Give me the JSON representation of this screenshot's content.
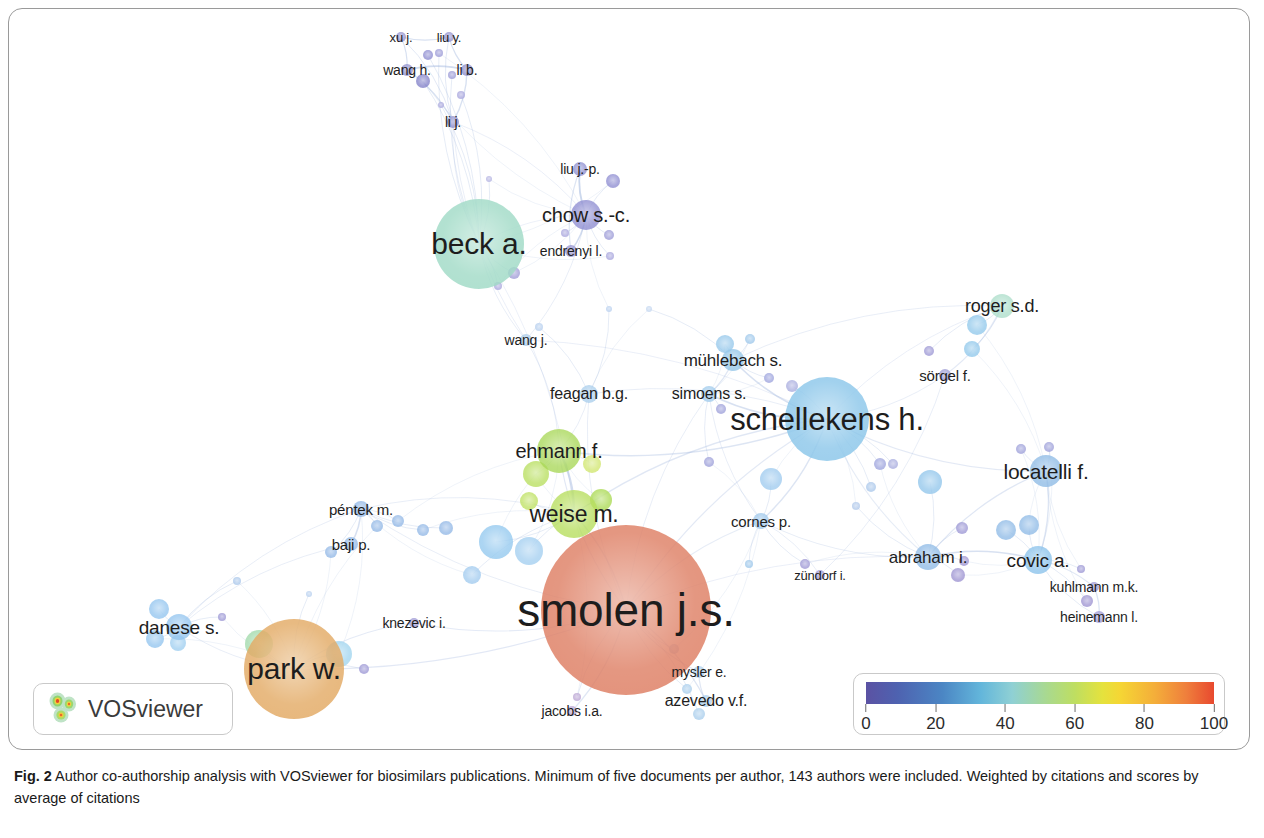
{
  "figure": {
    "label": "Fig. 2",
    "caption": "Author co-authorship analysis with VOSviewer for biosimilars publications. Minimum of five documents per author, 143 authors were included. Weighted by citations and scores by average of citations"
  },
  "branding": {
    "name": "VOSviewer",
    "logo_icon": "vosviewer-heatmap-logo-icon"
  },
  "legend": {
    "title": "",
    "ticks": [
      "0",
      "20",
      "40",
      "60",
      "80",
      "100"
    ],
    "min": 0,
    "max": 100,
    "gradient_stops": [
      "#5b52a3",
      "#4b86c4",
      "#63b6db",
      "#a9d98f",
      "#e5e23d",
      "#f4ae3a",
      "#e8492f"
    ]
  },
  "chart_data": {
    "type": "scatter",
    "title": "Author co-authorship analysis with VOSviewer for biosimilars publications",
    "xlabel": "",
    "ylabel": "",
    "color_scale": {
      "label": "average citations",
      "min": 0,
      "max": 100,
      "ticks": [
        0,
        20,
        40,
        60,
        80,
        100
      ]
    },
    "nodes": [
      {
        "label": "xu j.",
        "x": 392,
        "y": 28,
        "r": 5,
        "color": "#8f8ecd",
        "font": 13,
        "lx": 392,
        "ly": 28
      },
      {
        "label": "liu y.",
        "x": 440,
        "y": 28,
        "r": 5,
        "color": "#8f8ecd",
        "font": 13,
        "lx": 440,
        "ly": 28
      },
      {
        "label": "wang h.",
        "x": 398,
        "y": 61,
        "r": 6,
        "color": "#8c8bcb",
        "font": 14,
        "lx": 398,
        "ly": 61
      },
      {
        "label": "li b.",
        "x": 458,
        "y": 61,
        "r": 6,
        "color": "#8c8bcb",
        "font": 14,
        "lx": 458,
        "ly": 61
      },
      {
        "label": "li j.",
        "x": 444,
        "y": 113,
        "r": 6,
        "color": "#8c8bcb",
        "font": 14,
        "lx": 444,
        "ly": 113
      },
      {
        "label": "liu j.-p.",
        "x": 571,
        "y": 160,
        "r": 7,
        "color": "#8b8ace",
        "font": 14,
        "lx": 571,
        "ly": 160
      },
      {
        "label": "chow s.-c.",
        "x": 577,
        "y": 206,
        "r": 15,
        "color": "#8b89cf",
        "font": 20,
        "lx": 577,
        "ly": 206
      },
      {
        "label": "endrenyi l.",
        "x": 562,
        "y": 242,
        "r": 6,
        "color": "#8d8ccd",
        "font": 14,
        "lx": 562,
        "ly": 242
      },
      {
        "label": "beck a.",
        "x": 470,
        "y": 235,
        "r": 45,
        "color": "#9ed9c4",
        "font": 30,
        "lx": 470,
        "ly": 235
      },
      {
        "label": "wang j.",
        "x": 517,
        "y": 331,
        "r": 6,
        "color": "#a5c8e8",
        "font": 14,
        "lx": 517,
        "ly": 331
      },
      {
        "label": "mühlebach s.",
        "x": 724,
        "y": 351,
        "r": 11,
        "color": "#8fc4e8",
        "font": 17,
        "lx": 724,
        "ly": 351
      },
      {
        "label": "roger s.d.",
        "x": 993,
        "y": 297,
        "r": 12,
        "color": "#a9dcc8",
        "font": 18,
        "lx": 993,
        "ly": 297
      },
      {
        "label": "sörgel f.",
        "x": 936,
        "y": 366,
        "r": 6,
        "color": "#9a97d2",
        "font": 15,
        "lx": 936,
        "ly": 366
      },
      {
        "label": "feagan b.g.",
        "x": 580,
        "y": 385,
        "r": 9,
        "color": "#a8cdec",
        "font": 16,
        "lx": 580,
        "ly": 385
      },
      {
        "label": "simoens s.",
        "x": 700,
        "y": 385,
        "r": 8,
        "color": "#9dc9ec",
        "font": 16,
        "lx": 700,
        "ly": 385
      },
      {
        "label": "schellekens h.",
        "x": 818,
        "y": 410,
        "r": 42,
        "color": "#87c4e9",
        "font": 31,
        "lx": 818,
        "ly": 410
      },
      {
        "label": "ehmann f.",
        "x": 550,
        "y": 442,
        "r": 22,
        "color": "#a5d652",
        "font": 20,
        "lx": 550,
        "ly": 442
      },
      {
        "label": "locatelli f.",
        "x": 1037,
        "y": 462,
        "r": 16,
        "color": "#8bb8e4",
        "font": 21,
        "lx": 1037,
        "ly": 462
      },
      {
        "label": "weise m.",
        "x": 565,
        "y": 505,
        "r": 24,
        "color": "#b3dc56",
        "font": 23,
        "lx": 565,
        "ly": 505
      },
      {
        "label": "péntek m.",
        "x": 352,
        "y": 500,
        "r": 8,
        "color": "#8fb6e6",
        "font": 15,
        "lx": 352,
        "ly": 500
      },
      {
        "label": "cornes p.",
        "x": 752,
        "y": 512,
        "r": 8,
        "color": "#9cc6ea",
        "font": 15,
        "lx": 752,
        "ly": 512
      },
      {
        "label": "baji p.",
        "x": 342,
        "y": 535,
        "r": 7,
        "color": "#8fb6e6",
        "font": 15,
        "lx": 342,
        "ly": 535
      },
      {
        "label": "abraham i.",
        "x": 919,
        "y": 548,
        "r": 13,
        "color": "#8cb9e6",
        "font": 17,
        "lx": 919,
        "ly": 548
      },
      {
        "label": "covic a.",
        "x": 1029,
        "y": 551,
        "r": 14,
        "color": "#87c0ea",
        "font": 19,
        "lx": 1029,
        "ly": 551
      },
      {
        "label": "zündorf i.",
        "x": 811,
        "y": 566,
        "r": 5,
        "color": "#9b95d4",
        "font": 13,
        "lx": 811,
        "ly": 566
      },
      {
        "label": "kuhlmann m.k.",
        "x": 1085,
        "y": 578,
        "r": 5,
        "color": "#9a95d4",
        "font": 14,
        "lx": 1085,
        "ly": 578
      },
      {
        "label": "smolen j.s.",
        "x": 617,
        "y": 601,
        "r": 85,
        "color": "#dd7a5e",
        "font": 46,
        "lx": 617,
        "ly": 601
      },
      {
        "label": "heinemann l.",
        "x": 1090,
        "y": 608,
        "r": 6,
        "color": "#9a95d4",
        "font": 14,
        "lx": 1090,
        "ly": 608
      },
      {
        "label": "danese s.",
        "x": 170,
        "y": 618,
        "r": 13,
        "color": "#8fc3ee",
        "font": 19,
        "lx": 170,
        "ly": 618
      },
      {
        "label": "knezevic i.",
        "x": 405,
        "y": 614,
        "r": 5,
        "color": "#9a95d4",
        "font": 14,
        "lx": 405,
        "ly": 614
      },
      {
        "label": "park w.",
        "x": 285,
        "y": 660,
        "r": 50,
        "color": "#e2a75f",
        "font": 30,
        "lx": 285,
        "ly": 660
      },
      {
        "label": "mysler e.",
        "x": 690,
        "y": 663,
        "r": 6,
        "color": "#a8cdec",
        "font": 14,
        "lx": 690,
        "ly": 663
      },
      {
        "label": "azevedo v.f.",
        "x": 697,
        "y": 692,
        "r": 6,
        "color": "#a8cdec",
        "font": 16,
        "lx": 697,
        "ly": 692
      },
      {
        "label": "jacobs i.a.",
        "x": 563,
        "y": 702,
        "r": 5,
        "color": "#b9a3d2",
        "font": 14,
        "lx": 563,
        "ly": 702
      }
    ],
    "clusters": [
      {
        "name": "chinese-biostatistics-cluster",
        "color": "#8b89cf",
        "members": [
          "xu j.",
          "liu y.",
          "wang h.",
          "li b.",
          "li j.",
          "liu j.-p.",
          "chow s.-c.",
          "endrenyi l."
        ]
      },
      {
        "name": "regulatory-science-cluster",
        "color": "#a5d652",
        "members": [
          "ehmann f.",
          "weise m."
        ]
      },
      {
        "name": "rheumatology-cluster",
        "color": "#dd7a5e",
        "members": [
          "smolen j.s.",
          "park w.",
          "jacobs i.a.",
          "mysler e.",
          "azevedo v.f."
        ]
      },
      {
        "name": "immunogenicity-cluster",
        "color": "#87c4e9",
        "members": [
          "schellekens h.",
          "simoens s.",
          "mühlebach s.",
          "cornes p.",
          "locatelli f.",
          "covic a.",
          "abraham i.",
          "roger s.d."
        ]
      }
    ]
  }
}
